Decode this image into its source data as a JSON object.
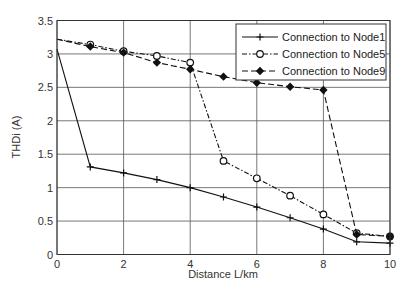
{
  "chart_data": {
    "type": "line",
    "title": "",
    "xlabel": "Distance L/km",
    "ylabel": "THDi (A)",
    "xlim": [
      0,
      10
    ],
    "ylim": [
      0,
      3.5
    ],
    "xticks": [
      0,
      2,
      4,
      6,
      8,
      10
    ],
    "yticks": [
      0,
      0.5,
      1,
      1.5,
      2,
      2.5,
      3,
      3.5
    ],
    "grid": true,
    "legend_position": "upper right",
    "x": [
      0,
      1,
      2,
      3,
      4,
      5,
      6,
      7,
      8,
      9,
      10
    ],
    "series": [
      {
        "name": "Connection to Node1",
        "style": "solid",
        "marker": "plus",
        "values": [
          3.07,
          1.31,
          1.22,
          1.12,
          1.0,
          0.86,
          0.71,
          0.55,
          0.38,
          0.19,
          0.17
        ]
      },
      {
        "name": "Connection to Node5",
        "style": "dash-dot",
        "marker": "open-circle",
        "values": [
          3.22,
          3.14,
          3.04,
          2.97,
          2.87,
          1.4,
          1.14,
          0.88,
          0.6,
          0.32,
          0.27
        ]
      },
      {
        "name": "Connection to Node9",
        "style": "dashed",
        "marker": "filled-diamond",
        "values": [
          3.22,
          3.11,
          3.02,
          2.87,
          2.77,
          2.66,
          2.57,
          2.51,
          2.46,
          0.3,
          0.27
        ]
      }
    ]
  },
  "colors": {
    "line": "#111111",
    "grid": "#555555",
    "background": "#ffffff"
  }
}
